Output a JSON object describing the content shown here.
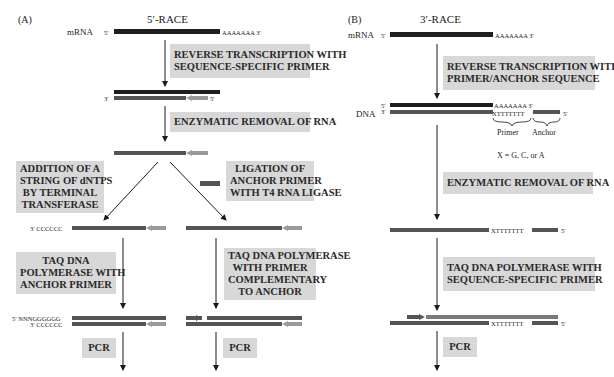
{
  "panel_a": {
    "label": "(A)",
    "title": "5′-RACE",
    "mrna_label": "mRNA",
    "five_prime": "5′",
    "three_prime": "3′",
    "poly_a": "AAAAAAA 3′",
    "steps": {
      "reverse_transcription": [
        "REVERSE TRANSCRIPTION WITH",
        "SEQUENCE-SPECIFIC PRIMER"
      ],
      "rna_removal": [
        "ENZYMATIC REMOVAL OF RNA"
      ],
      "tailing": [
        "ADDITION OF A",
        "STRING OF dNTPS",
        "BY TERMINAL",
        "TRANSFERASE"
      ],
      "ligation": [
        "LIGATION OF",
        "ANCHOR PRIMER",
        "WITH T4 RNA LIGASE"
      ],
      "taq_anchor": [
        "TAQ DNA",
        "POLYMERASE WITH",
        "ANCHOR PRIMER"
      ],
      "taq_complementary": [
        "TAQ DNA POLYMERASE",
        "WITH PRIMER",
        "COMPLEMENTARY",
        "TO ANCHOR"
      ],
      "pcr_left": "PCR",
      "pcr_right": "PCR"
    },
    "tail_c": "3′ CCCCCC",
    "tail_ng": "5′ NNNGGGGGG",
    "tail_c2": "3′ CCCCCC"
  },
  "panel_b": {
    "label": "(B)",
    "title": "3′-RACE",
    "mrna_label": "mRNA",
    "dna_label": "DNA",
    "five_prime": "5′",
    "three_prime": "3′",
    "poly_a": "AAAAAAA 3′",
    "poly_a_short": "AAAAAAA 3′",
    "xt": "XTTTTTTT",
    "primer_label": "Primer",
    "anchor_label": "Anchor",
    "x_note": "X = G, C, or A",
    "steps": {
      "reverse_transcription": [
        "REVERSE TRANSCRIPTION WITH",
        "PRIMER/ANCHOR SEQUENCE"
      ],
      "rna_removal": [
        "ENZYMATIC REMOVAL OF RNA"
      ],
      "taq": [
        "TAQ DNA POLYMERASE WITH",
        "SEQUENCE-SPECIFIC PRIMER"
      ],
      "pcr": "PCR"
    }
  },
  "colors": {
    "rna": "#1e1e1e",
    "dna": "#545454",
    "primer": "#9a9a9a",
    "box": "#d8d8d8"
  }
}
